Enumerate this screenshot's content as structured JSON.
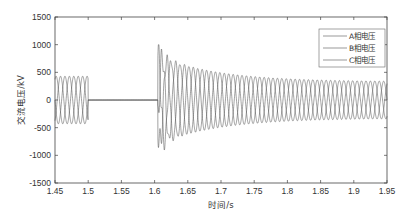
{
  "chart_data": {
    "type": "line",
    "title": "",
    "xlabel": "时间/s",
    "ylabel": "交流电压/kV",
    "xlim": [
      1.45,
      1.95
    ],
    "ylim": [
      -1500,
      1500
    ],
    "xticks": [
      1.45,
      1.5,
      1.55,
      1.6,
      1.65,
      1.7,
      1.75,
      1.8,
      1.85,
      1.9,
      1.95
    ],
    "xtick_labels": [
      "1.45",
      "1.5",
      "1.55",
      "1.6",
      "1.65",
      "1.7",
      "1.75",
      "1.8",
      "1.85",
      "1.9",
      "1.95"
    ],
    "yticks": [
      1500,
      1000,
      500,
      0,
      -500,
      -1000,
      -1500
    ],
    "ytick_labels": [
      "1500",
      "1000",
      "500",
      "0",
      "-500",
      "-1000",
      "-1500"
    ],
    "grid": false,
    "legend_position": "upper right",
    "series": [
      {
        "name": "A相电压",
        "phase_deg": 0
      },
      {
        "name": "B相电压",
        "phase_deg": -120
      },
      {
        "name": "C相电压",
        "phase_deg": 120
      }
    ],
    "segments": [
      {
        "t_start": 1.45,
        "t_end": 1.5,
        "description": "normal operation",
        "amplitude": 430,
        "frequency_hz": 50
      },
      {
        "t_start": 1.5,
        "t_end": 1.605,
        "description": "voltage collapsed to zero",
        "amplitude": 0
      },
      {
        "t_start": 1.605,
        "t_end": 1.95,
        "description": "recovery with overvoltage decaying",
        "peak_max": 1000,
        "peak_min": -1150,
        "amplitude_initial": 800,
        "amplitude_final": 330,
        "frequency_hz": 50
      }
    ],
    "line_color": "#555555"
  },
  "legend": {
    "items": [
      "A相电压",
      "B相电压",
      "C相电压"
    ]
  }
}
